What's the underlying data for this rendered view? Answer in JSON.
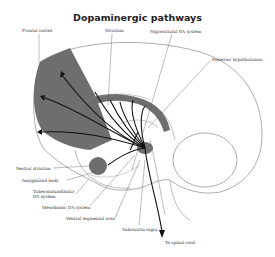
{
  "title": "Dopaminergic pathways",
  "labels": {
    "frontal_cortex": "Frontal cortex",
    "striatum": "Striatum",
    "nigrostriatal": "Nigrostriatal DA system",
    "posterior_hypothalamus": "Posterior hypothalamus",
    "ventral_striatum": "Ventral striatum",
    "amygdaloid_body": "Amygdaloid body",
    "tuberoinfundibular_1": "Tuberoinfundibular",
    "tuberoinfundibular_2": "DA system",
    "mesolimbic": "Mesolimbic DA system",
    "ventral_tegmental": "Ventral tegmental area",
    "substantia_nigra": "Substantia nigra",
    "spinal_cord": "To spinal cord"
  },
  "colors": {
    "shade": "#6e6e6e",
    "line": "#555555",
    "pathway": "#111111"
  }
}
